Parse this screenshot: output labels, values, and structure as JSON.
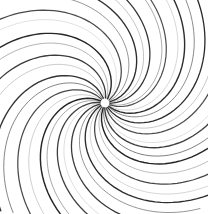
{
  "canvas": {
    "width": 208,
    "height": 214,
    "background_color": "#ffffff",
    "title": "Radial spiral burst",
    "has_border": false,
    "has_text": false
  },
  "artwork": {
    "type": "radial-spiral-burst",
    "name": "spiral-vortex",
    "center_x": 105,
    "center_y": 103,
    "inner_radius": 5,
    "outer_radius": 150,
    "arm_count": 28,
    "rotation_direction": "counterclockwise",
    "sweep_degrees": 112,
    "start_angle_offset_degrees": 4,
    "fade_start_radius": 5,
    "fade_full_radius": 30,
    "stroke_min_width": 0.7,
    "stroke_max_width": 1.5,
    "bounds": {
      "left": 8,
      "top": 8,
      "right": 200,
      "bottom": 205
    },
    "palette": {
      "background": "#ffffff",
      "darkest": "#1a1a1a",
      "dark": "#333333",
      "mid": "#5a5a5a",
      "light": "#8f8f8f",
      "lightest": "#b8b8b8"
    },
    "arms": [
      {
        "angle": 0,
        "color": "#2b2b2b",
        "width": 1.3,
        "sweep": 115,
        "length": 148,
        "opacity": 0.95
      },
      {
        "angle": 13,
        "color": "#7d7d7d",
        "width": 0.9,
        "sweep": 108,
        "length": 140,
        "opacity": 0.72
      },
      {
        "angle": 19,
        "color": "#3a3a3a",
        "width": 1.2,
        "sweep": 118,
        "length": 150,
        "opacity": 0.9
      },
      {
        "angle": 30,
        "color": "#ababab",
        "width": 0.8,
        "sweep": 104,
        "length": 134,
        "opacity": 0.6
      },
      {
        "angle": 38,
        "color": "#242424",
        "width": 1.4,
        "sweep": 120,
        "length": 152,
        "opacity": 0.96
      },
      {
        "angle": 45,
        "color": "#6a6a6a",
        "width": 1.0,
        "sweep": 110,
        "length": 143,
        "opacity": 0.78
      },
      {
        "angle": 56,
        "color": "#1f1f1f",
        "width": 1.3,
        "sweep": 116,
        "length": 149,
        "opacity": 0.95
      },
      {
        "angle": 64,
        "color": "#9a9a9a",
        "width": 0.85,
        "sweep": 106,
        "length": 137,
        "opacity": 0.64
      },
      {
        "angle": 73,
        "color": "#383838",
        "width": 1.25,
        "sweep": 119,
        "length": 151,
        "opacity": 0.9
      },
      {
        "angle": 83,
        "color": "#b4b4b4",
        "width": 0.75,
        "sweep": 100,
        "length": 130,
        "opacity": 0.55
      },
      {
        "angle": 90,
        "color": "#2e2e2e",
        "width": 1.35,
        "sweep": 117,
        "length": 150,
        "opacity": 0.93
      },
      {
        "angle": 99,
        "color": "#5f5f5f",
        "width": 1.0,
        "sweep": 109,
        "length": 141,
        "opacity": 0.8
      },
      {
        "angle": 109,
        "color": "#1c1c1c",
        "width": 1.4,
        "sweep": 121,
        "length": 153,
        "opacity": 0.97
      },
      {
        "angle": 117,
        "color": "#8d8d8d",
        "width": 0.85,
        "sweep": 105,
        "length": 136,
        "opacity": 0.68
      },
      {
        "angle": 128,
        "color": "#333333",
        "width": 1.25,
        "sweep": 114,
        "length": 147,
        "opacity": 0.91
      },
      {
        "angle": 137,
        "color": "#a6a6a6",
        "width": 0.8,
        "sweep": 102,
        "length": 132,
        "opacity": 0.58
      },
      {
        "angle": 146,
        "color": "#222222",
        "width": 1.35,
        "sweep": 118,
        "length": 151,
        "opacity": 0.95
      },
      {
        "angle": 155,
        "color": "#6e6e6e",
        "width": 0.95,
        "sweep": 111,
        "length": 142,
        "opacity": 0.76
      },
      {
        "angle": 166,
        "color": "#2a2a2a",
        "width": 1.3,
        "sweep": 116,
        "length": 149,
        "opacity": 0.93
      },
      {
        "angle": 175,
        "color": "#b0b0b0",
        "width": 0.75,
        "sweep": 101,
        "length": 131,
        "opacity": 0.56
      },
      {
        "angle": 184,
        "color": "#303030",
        "width": 1.3,
        "sweep": 119,
        "length": 151,
        "opacity": 0.92
      },
      {
        "angle": 194,
        "color": "#7a7a7a",
        "width": 0.9,
        "sweep": 107,
        "length": 139,
        "opacity": 0.73
      },
      {
        "angle": 203,
        "color": "#1e1e1e",
        "width": 1.45,
        "sweep": 122,
        "length": 154,
        "opacity": 0.97
      },
      {
        "angle": 213,
        "color": "#9e9e9e",
        "width": 0.8,
        "sweep": 103,
        "length": 133,
        "opacity": 0.62
      },
      {
        "angle": 224,
        "color": "#353535",
        "width": 1.25,
        "sweep": 115,
        "length": 148,
        "opacity": 0.9
      },
      {
        "angle": 236,
        "color": "#646464",
        "width": 1.0,
        "sweep": 110,
        "length": 143,
        "opacity": 0.79
      },
      {
        "angle": 248,
        "color": "#262626",
        "width": 1.35,
        "sweep": 118,
        "length": 150,
        "opacity": 0.94
      },
      {
        "angle": 262,
        "color": "#a0a0a0",
        "width": 0.85,
        "sweep": 104,
        "length": 135,
        "opacity": 0.63
      },
      {
        "angle": 274,
        "color": "#2c2c2c",
        "width": 1.3,
        "sweep": 117,
        "length": 149,
        "opacity": 0.93
      },
      {
        "angle": 286,
        "color": "#888888",
        "width": 0.9,
        "sweep": 106,
        "length": 138,
        "opacity": 0.7
      },
      {
        "angle": 298,
        "color": "#1d1d1d",
        "width": 1.4,
        "sweep": 120,
        "length": 152,
        "opacity": 0.96
      },
      {
        "angle": 310,
        "color": "#b6b6b6",
        "width": 0.75,
        "sweep": 100,
        "length": 129,
        "opacity": 0.54
      },
      {
        "angle": 320,
        "color": "#373737",
        "width": 1.25,
        "sweep": 116,
        "length": 148,
        "opacity": 0.91
      },
      {
        "angle": 332,
        "color": "#707070",
        "width": 0.95,
        "sweep": 108,
        "length": 140,
        "opacity": 0.77
      },
      {
        "angle": 344,
        "color": "#212121",
        "width": 1.35,
        "sweep": 119,
        "length": 151,
        "opacity": 0.95
      },
      {
        "angle": 352,
        "color": "#959595",
        "width": 0.85,
        "sweep": 105,
        "length": 136,
        "opacity": 0.66
      }
    ]
  }
}
